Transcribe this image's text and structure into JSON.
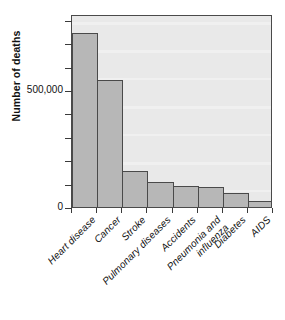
{
  "figure": {
    "top_clipped_text": "",
    "background_color": "#ffffff",
    "plot_background_color": "#e9e9e9",
    "bar_fill_color": "#b7b7b7",
    "bar_edge_color": "#4a4a4a",
    "axis_color": "#3a3a3a"
  },
  "chart_data": {
    "type": "bar",
    "title": "",
    "xlabel": "",
    "ylabel": "Number of deaths",
    "categories": [
      "Heart disease",
      "Cancer",
      "Stroke",
      "Pulmonary diseases",
      "Accidents",
      "Pneumonia and influenza",
      "Diabetes",
      "AIDS"
    ],
    "category_lines": [
      [
        "Heart disease"
      ],
      [
        "Cancer"
      ],
      [
        "Stroke"
      ],
      [
        "Pulmonary diseases"
      ],
      [
        "Accidents"
      ],
      [
        "Pneumonia and",
        "influenza"
      ],
      [
        "Diabetes"
      ],
      [
        "AIDS"
      ]
    ],
    "values": [
      744000,
      543000,
      154000,
      107000,
      88000,
      85000,
      60000,
      26000
    ],
    "ylim": [
      0,
      825000
    ],
    "ytick_values": [
      0,
      100000,
      200000,
      300000,
      400000,
      500000,
      600000,
      700000,
      800000
    ],
    "ytick_labels": [
      "0",
      "",
      "",
      "",
      "",
      "500,000",
      "",
      "",
      ""
    ],
    "grid": false,
    "legend": null,
    "legend_position": "none"
  }
}
